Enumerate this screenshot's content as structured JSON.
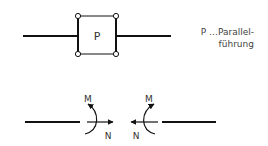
{
  "top_diagram": {
    "box_label": "P"
  },
  "legend": {
    "line1": "P …Parallel-",
    "line2": "führung"
  },
  "bottom_diagram": {
    "left": {
      "moment_label": "M",
      "normal_label": "N"
    },
    "right": {
      "moment_label": "M",
      "normal_label": "N"
    }
  },
  "colors": {
    "stroke": "#111111",
    "text": "#333333"
  }
}
